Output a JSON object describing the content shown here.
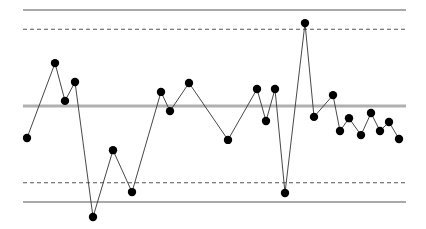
{
  "chart_data": {
    "type": "line",
    "subtype": "control-chart",
    "title": "",
    "xlabel": "",
    "ylabel": "",
    "grid": false,
    "legend": null,
    "units": "sigma from center line",
    "ylim": [
      -3.6,
      3.0
    ],
    "center_line": 0,
    "limits": {
      "upper_control_limit": 3.0,
      "upper_warning_limit": 2.4,
      "lower_warning_limit": -2.4,
      "lower_control_limit": -3.0
    },
    "x": [
      1,
      2,
      3,
      4,
      5,
      6,
      7,
      8,
      9,
      10,
      11,
      12,
      13,
      14,
      15,
      16,
      17,
      18,
      19,
      20,
      21,
      22,
      23,
      24,
      25
    ],
    "x_px": [
      27,
      55,
      65,
      75,
      93,
      113,
      132,
      161,
      170,
      189,
      228,
      257,
      266,
      275,
      285,
      305,
      314,
      333,
      340,
      349,
      361,
      371,
      380,
      389,
      399
    ],
    "series": [
      {
        "name": "observations",
        "values": [
          -1.0,
          1.34,
          0.16,
          0.75,
          -3.47,
          -1.38,
          -2.69,
          0.44,
          -0.16,
          0.72,
          -1.06,
          0.53,
          -0.47,
          0.53,
          -2.72,
          2.59,
          -0.34,
          0.34,
          -0.78,
          -0.38,
          -0.91,
          -0.22,
          -0.78,
          -0.5,
          -1.03
        ]
      }
    ]
  },
  "style": {
    "line_color": "#333333",
    "point_color": "#000000",
    "center_line_color": "#b0b0b0",
    "limit_line_color": "#555555",
    "background": "#ffffff"
  },
  "layout": {
    "plot_left": 23,
    "plot_right": 406,
    "center_y": 106,
    "px_per_unit": 32
  }
}
